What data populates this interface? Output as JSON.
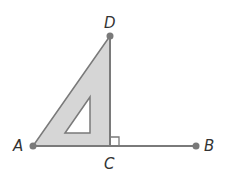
{
  "diagram": {
    "points": [
      {
        "id": "A",
        "label": "A",
        "x": 33,
        "y": 146
      },
      {
        "id": "B",
        "label": "B",
        "x": 196,
        "y": 146
      },
      {
        "id": "C",
        "label": "C",
        "x": 110,
        "y": 146
      },
      {
        "id": "D",
        "label": "D",
        "x": 110,
        "y": 36
      }
    ],
    "segments": [
      [
        "A",
        "B"
      ],
      [
        "C",
        "D"
      ]
    ],
    "set_square": {
      "outer": [
        [
          33,
          146
        ],
        [
          110,
          36
        ],
        [
          110,
          146
        ]
      ],
      "hole": [
        [
          65,
          133
        ],
        [
          90,
          97
        ],
        [
          90,
          133
        ]
      ]
    },
    "right_angle_at": "C",
    "colors": {
      "line": "#7a7a7a",
      "fill": "#d9d9d9",
      "point": "#7a7a7a",
      "label": "#333333"
    }
  }
}
